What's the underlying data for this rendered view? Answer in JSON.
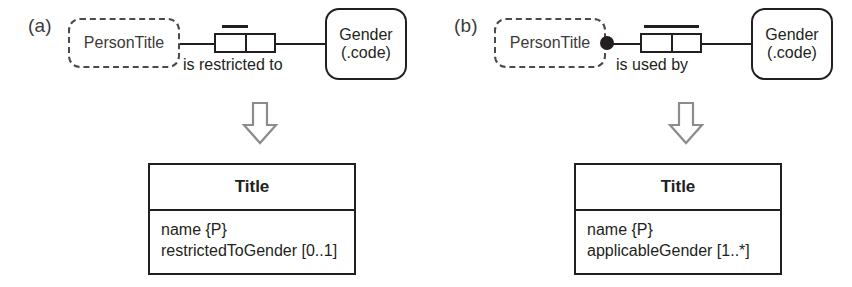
{
  "figure": {
    "type": "orm-to-uml-mapping-diagram",
    "panels": [
      {
        "letter": "(a)",
        "orm": {
          "left_object_type": {
            "label": "PersonTitle",
            "shape": "dashed-rounded-rectangle",
            "role_constraint": "optional"
          },
          "predicate_label": "is restricted to",
          "role_count": 2,
          "uniqueness_constraint": "single-role",
          "right_object_type": {
            "label": "Gender",
            "sublabel": "(.code)",
            "shape": "solid-rounded-rectangle"
          }
        },
        "arrow": "down-arrow-icon",
        "uml": {
          "class_name": "Title",
          "attributes": [
            "name {P}",
            "restrictedToGender [0..1]"
          ]
        }
      },
      {
        "letter": "(b)",
        "orm": {
          "left_object_type": {
            "label": "PersonTitle",
            "shape": "dashed-rounded-rectangle",
            "role_constraint": "mandatory"
          },
          "predicate_label": "is used by",
          "role_count": 2,
          "uniqueness_constraint": "spanning",
          "right_object_type": {
            "label": "Gender",
            "sublabel": "(.code)",
            "shape": "solid-rounded-rectangle"
          }
        },
        "arrow": "down-arrow-icon",
        "uml": {
          "class_name": "Title",
          "attributes": [
            "name {P}",
            "applicableGender [1..*]"
          ]
        }
      }
    ],
    "colors": {
      "ink": "#231f20",
      "dashed_outline": "#4a4a4a",
      "arrow_outline": "#8c8c8c",
      "background": "#ffffff"
    }
  }
}
